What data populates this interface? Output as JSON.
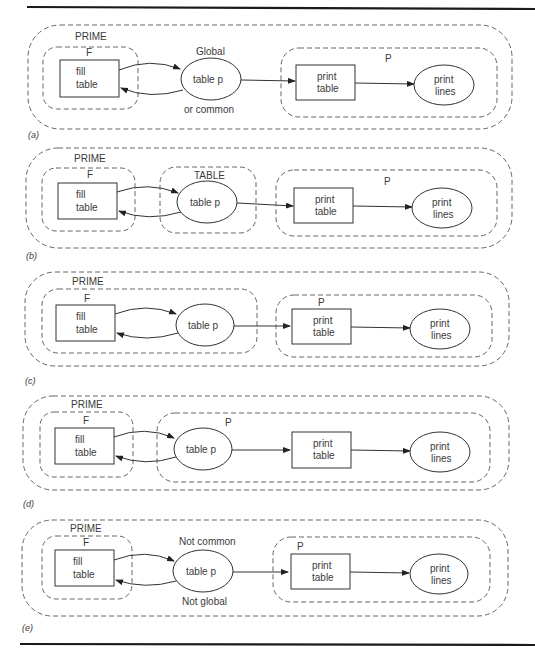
{
  "figure": {
    "panels": [
      {
        "caption": "(a)",
        "outer_label": "PRIME",
        "f_label": "F",
        "fill_table": [
          "fill",
          "table"
        ],
        "table_p": "table p",
        "note_top": "Global",
        "note_bottom": "or common",
        "p_label": "P",
        "print_table": [
          "print",
          "table"
        ],
        "print_lines": [
          "print",
          "lines"
        ]
      },
      {
        "caption": "(b)",
        "outer_label": "PRIME",
        "f_label": "F",
        "fill_table": [
          "fill",
          "table"
        ],
        "table_box_label": "TABLE",
        "table_p": "table p",
        "p_label": "P",
        "print_table": [
          "print",
          "table"
        ],
        "print_lines": [
          "print",
          "lines"
        ]
      },
      {
        "caption": "(c)",
        "outer_label": "PRIME",
        "f_label": "F",
        "fill_table": [
          "fill",
          "table"
        ],
        "table_p": "table p",
        "p_label": "P",
        "print_table": [
          "print",
          "table"
        ],
        "print_lines": [
          "print",
          "lines"
        ]
      },
      {
        "caption": "(d)",
        "outer_label": "PRIME",
        "f_label": "F",
        "fill_table": [
          "fill",
          "table"
        ],
        "table_p": "table p",
        "p_label": "P",
        "print_table": [
          "print",
          "table"
        ],
        "print_lines": [
          "print",
          "lines"
        ]
      },
      {
        "caption": "(e)",
        "outer_label": "PRIME",
        "f_label": "F",
        "fill_table": [
          "fill",
          "table"
        ],
        "table_p": "table p",
        "note_top": "Not common",
        "note_bottom": "Not global",
        "p_label": "P",
        "print_table": [
          "print",
          "table"
        ],
        "print_lines": [
          "print",
          "lines"
        ]
      }
    ]
  }
}
